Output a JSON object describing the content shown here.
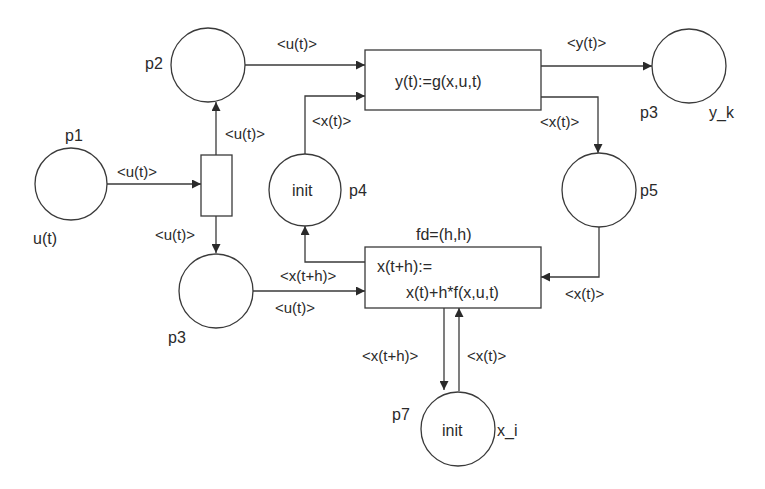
{
  "diagram": {
    "type": "petri-net",
    "places": {
      "p1": {
        "name": "p1",
        "token": "",
        "annotation": "u(t)"
      },
      "p2": {
        "name": "p2",
        "token": ""
      },
      "p3a": {
        "name": "p3",
        "token": ""
      },
      "p3b": {
        "name": "p3",
        "token": "",
        "annotation": "y_k"
      },
      "p4": {
        "name": "p4",
        "token": "init"
      },
      "p5": {
        "name": "p5",
        "token": ""
      },
      "p7": {
        "name": "p7",
        "token": "init",
        "annotation": "x_i"
      }
    },
    "transitions": {
      "split": {
        "label": ""
      },
      "output": {
        "label": "y(t):=g(x,u,t)"
      },
      "integrate": {
        "label_line1": "x(t+h):=",
        "label_line2": "x(t)+h*f(x,u,t)",
        "delay": "fd=(h,h)"
      }
    },
    "arcs": {
      "p1_split": "<u(t)>",
      "split_p2": "<u(t)>",
      "split_p3": "<u(t)>",
      "p2_output": "<u(t)>",
      "p4_output": "<x(t)>",
      "output_p3b": "<y(t)>",
      "output_p5": "<x(t)>",
      "p5_integrate": "<x(t)>",
      "integrate_p4": "<x(t+h)>",
      "p3_integrate": "<u(t)>",
      "integrate_p7": "<x(t+h)>",
      "p7_integrate": "<x(t)>"
    }
  }
}
